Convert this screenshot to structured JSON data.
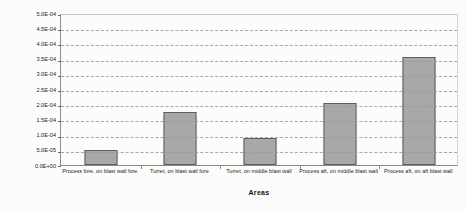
{
  "chart_data": {
    "type": "bar",
    "title": "",
    "xlabel": "Areas",
    "ylabel": "Frequency of loads exceeding design basis",
    "categories": [
      "Process fore, on blast wall fore",
      "Turret, on blast wall fore",
      "Turret, on middle blast wall",
      "Process aft, on middle blast wall",
      "Process aft, on aft blast wall"
    ],
    "values": [
      5e-05,
      0.000175,
      9e-05,
      0.000205,
      0.000355
    ],
    "ylim": [
      0,
      0.0005
    ],
    "ytick_values": [
      0,
      5e-05,
      0.0001,
      0.00015,
      0.0002,
      0.00025,
      0.0003,
      0.00035,
      0.0004,
      0.00045,
      0.0005
    ],
    "ytick_labels": [
      "0.0E+00",
      "5.0E-05",
      "1.0E-04",
      "1.5E-04",
      "2.0E-04",
      "2.5E-04",
      "3.0E-04",
      "3.5E-04",
      "4.0E-04",
      "4.5E-04",
      "5.0E-04"
    ],
    "grid": true,
    "legend": false,
    "bar_color": "#a8a8a8",
    "bar_border_color": "#5e5e5e",
    "gridline_color": "#9a9a9a",
    "axis_color": "#8c8c8c"
  }
}
